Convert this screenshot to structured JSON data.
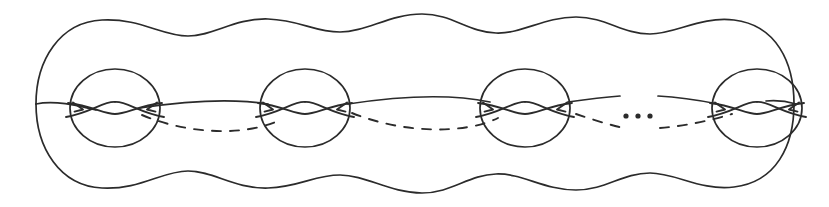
{
  "figure": {
    "width": 829,
    "height": 207,
    "background_color": "#ffffff",
    "ink_color": "#2b2b2b",
    "stroke_width": 1.7
  },
  "outline": {
    "name": "wavy-blob-outline",
    "description": "Closed wavy outline of the surface, four bumps along the top and four along the bottom, rounded end caps at left and right",
    "top_path": "M 36,104 C 36,60 60,22 102,20 C 140,18 162,36 188,36 C 214,36 234,18 268,19 C 300,20 314,32 340,32 C 366,32 390,14 422,14 C 452,14 468,32 496,33 C 522,34 544,17 576,17 C 606,17 622,34 650,34 C 676,34 700,16 734,20 C 776,25 794,62 794,104",
    "bottom_path": "M 36,104 C 36,148 60,186 102,188 C 140,190 162,171 188,171 C 214,171 234,189 268,188 C 300,187 314,175 340,175 C 366,175 390,193 422,193 C 452,193 468,175 496,174 C 522,173 544,190 576,190 C 606,190 622,173 650,173 C 676,173 700,191 734,187 C 776,182 794,146 794,104"
  },
  "handles": [
    {
      "index": 1,
      "name": "handle-1",
      "center_x": 115,
      "center_y": 108,
      "radius_x": 45,
      "radius_y": 39,
      "label": "handle 1"
    },
    {
      "index": 2,
      "name": "handle-2",
      "center_x": 305,
      "center_y": 108,
      "radius_x": 45,
      "radius_y": 39,
      "label": "handle 2"
    },
    {
      "index": 3,
      "name": "handle-3",
      "center_x": 525,
      "center_y": 108,
      "radius_x": 45,
      "radius_y": 39,
      "label": "handle 3"
    },
    {
      "index": 4,
      "name": "handle-g",
      "center_x": 757,
      "center_y": 108,
      "radius_x": 45,
      "radius_y": 39,
      "label": "handle g"
    }
  ],
  "equator": {
    "name": "equator-curve",
    "solid_description": "Front (visible) arc of the equatorial curve, drawn solid, slightly undulating, broken by a gap at the ellipsis",
    "dashed_description": "Back (hidden) arc of the equatorial curve, drawn dashed, sagging below the solid arc between handles",
    "solid_segments": [
      "M 36,104 C 54,100 76,105 96,110",
      "M 140,108 C 180,102 230,98 268,104",
      "M 348,104 C 400,96 452,94 490,102",
      "M 568,102 C 590,99 608,97 620,96",
      "M 658,96 C 678,97 698,100 718,104",
      "M 796,104 C 786,101 776,100 766,101"
    ],
    "dashed_segments": [
      "M 142,115 C 190,135 246,136 280,120",
      "M 352,113 C 404,134 466,134 498,118",
      "M 576,114 C 600,122 614,126 624,128",
      "M 660,128 C 686,126 712,120 732,114"
    ]
  },
  "ellipsis": {
    "name": "ellipsis-dots",
    "text": "...",
    "dot_count": 3,
    "dot_radius": 2.6,
    "center_y": 116,
    "dot_x_positions": [
      626,
      638,
      650
    ]
  },
  "handle_crossing": {
    "name": "handle-crossing-lens",
    "description": "Inside each handle circle two arcs cross to form a lens (eye) shape; an arrowhead on each side points inward toward the lens",
    "lens_half_width": 13,
    "lens_half_height": 6,
    "arrow_offset_x": 33,
    "arrow_size": 9
  },
  "annotations": {
    "caption": ""
  }
}
